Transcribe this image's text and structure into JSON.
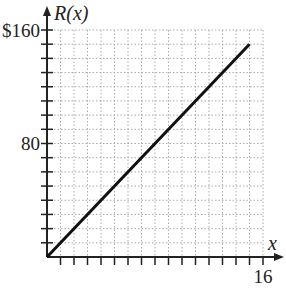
{
  "chart_data": {
    "type": "line",
    "title": "",
    "xlabel": "x",
    "ylabel": "R(x)",
    "xlim": [
      0,
      16
    ],
    "ylim": [
      0,
      160
    ],
    "x_ticks_major_every": 1,
    "y_ticks_major_every": 10,
    "x_tick_labels": [
      {
        "value": 16,
        "label": "16"
      }
    ],
    "y_tick_labels": [
      {
        "value": 80,
        "label": "80"
      },
      {
        "value": 160,
        "label": "$160"
      }
    ],
    "grid": true,
    "grid_style": "dotted",
    "legend": null,
    "series": [
      {
        "name": "R(x)",
        "x": [
          0,
          15
        ],
        "y": [
          0,
          150
        ],
        "color": "#111111"
      }
    ]
  },
  "labels": {
    "y_axis": "R(x)",
    "x_axis": "x",
    "y_top": "$160",
    "y_mid": "80",
    "x_right": "16"
  }
}
